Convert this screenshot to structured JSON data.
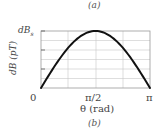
{
  "top_caption": "(a)",
  "bottom_caption": "(b)",
  "chart_data": {
    "type": "line",
    "title": "",
    "xlabel": "θ (rad)",
    "ylabel": "dB (pT)",
    "x_tick_labels": [
      "0",
      "π/2",
      "π"
    ],
    "y_tick_labels": [
      "dB_s"
    ],
    "y_top_label_main": "dB",
    "y_top_label_sub": "s",
    "xlim": [
      0,
      3.1416
    ],
    "ylim": [
      0,
      1
    ],
    "grid": true,
    "series": [
      {
        "name": "dB(θ)",
        "x": [
          0,
          0.3927,
          0.7854,
          1.1781,
          1.5708,
          1.9635,
          2.3562,
          2.7489,
          3.1416
        ],
        "values": [
          0,
          0.383,
          0.707,
          0.924,
          1.0,
          0.924,
          0.707,
          0.383,
          0
        ]
      }
    ],
    "annotations": [
      "curve is dB_s·sin θ, maximum dB_s at θ = π/2"
    ]
  }
}
